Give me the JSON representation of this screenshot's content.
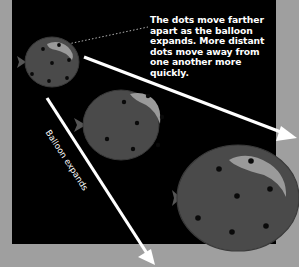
{
  "figure": {
    "caption": "The dots move farther apart as the balloon expands. More distant dots move away from one another more quickly.",
    "arrow_label": "Balloon expands"
  },
  "colors": {
    "background": "#9f9f9f",
    "panel": "#000000",
    "balloon_fill": "#4a4a4a",
    "balloon_rim": "#3a3a3a",
    "highlight": "#9a9a9a",
    "dot": "#0a0a0a",
    "arrow": "#ffffff"
  },
  "balloons": [
    {
      "name": "small",
      "cx": 52,
      "cy": 62,
      "rx": 27,
      "ry": 25,
      "dots": 7
    },
    {
      "name": "medium",
      "cx": 121,
      "cy": 125,
      "rx": 38,
      "ry": 35,
      "dots": 7
    },
    {
      "name": "large",
      "cx": 238,
      "cy": 198,
      "rx": 61,
      "ry": 53,
      "dots": 7
    }
  ]
}
